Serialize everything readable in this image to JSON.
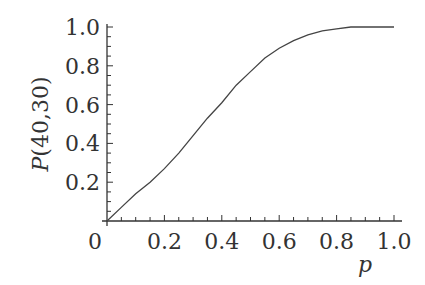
{
  "chart_data": {
    "type": "line",
    "title": "",
    "xlabel": "p",
    "ylabel": "P(40,30)",
    "xlim": [
      0,
      1.0
    ],
    "ylim": [
      0,
      1.0
    ],
    "grid": false,
    "legend": null,
    "x_ticks": [
      "0",
      "0.2",
      "0.4",
      "0.6",
      "0.8",
      "1.0"
    ],
    "y_ticks": [
      "0.2",
      "0.4",
      "0.6",
      "0.8",
      "1.0"
    ],
    "x_ticks_minor_step": 0.05,
    "y_ticks_minor_step": 0.05,
    "series": [
      {
        "name": "P(40,30)",
        "x": [
          0,
          0.05,
          0.1,
          0.15,
          0.2,
          0.25,
          0.3,
          0.35,
          0.4,
          0.45,
          0.5,
          0.55,
          0.6,
          0.65,
          0.7,
          0.75,
          0.8,
          0.85,
          0.9,
          0.95,
          1.0
        ],
        "values": [
          0,
          0.07,
          0.14,
          0.2,
          0.27,
          0.35,
          0.44,
          0.53,
          0.61,
          0.7,
          0.77,
          0.84,
          0.89,
          0.93,
          0.96,
          0.98,
          0.99,
          1.0,
          1.0,
          1.0,
          1.0
        ]
      }
    ]
  },
  "colors": {
    "line": "#444444",
    "axis": "#333333",
    "text": "#333333",
    "background": "#ffffff"
  }
}
